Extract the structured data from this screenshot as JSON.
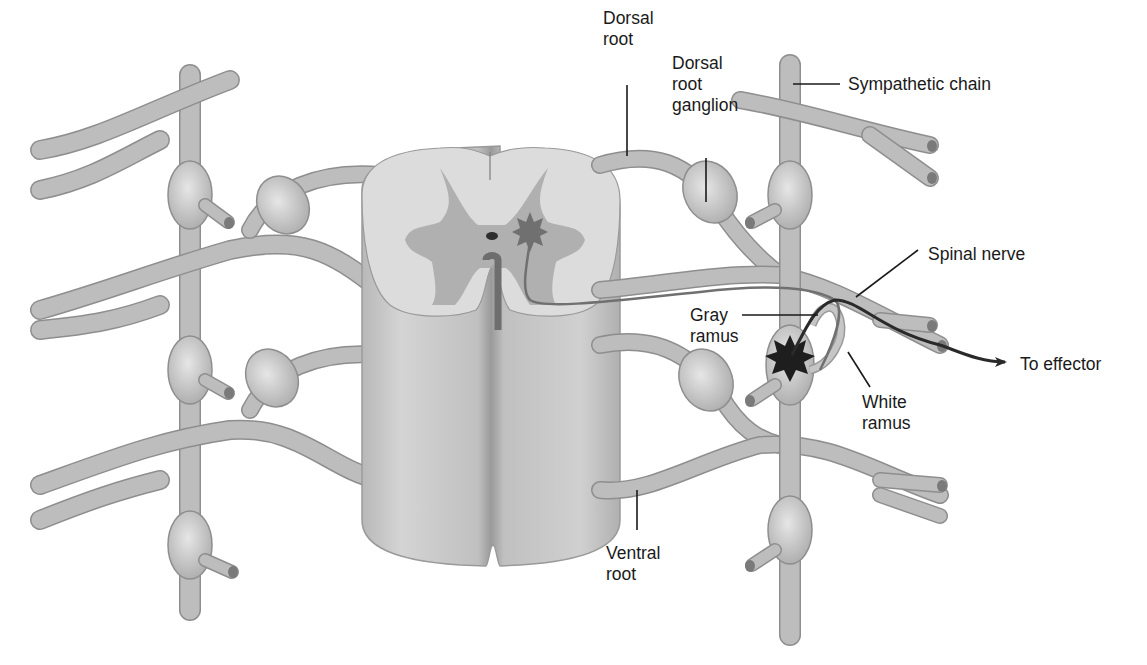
{
  "figure": {
    "colors": {
      "background": "#ffffff",
      "nerve_fill": "#c4c4c4",
      "nerve_edge": "#8e8e8e",
      "white_matter": "#dcdcdc",
      "gray_matter": "#a8a8a8",
      "preganglionic_neuron": "#707070",
      "postganglionic_neuron": "#1e1e1e",
      "label_text": "#1a1a1a"
    }
  },
  "labels": {
    "dorsal_root": "Dorsal\nroot",
    "dorsal_root_ganglion": "Dorsal\nroot\nganglion",
    "sympathetic_chain": "Sympathetic chain",
    "spinal_nerve": "Spinal nerve",
    "gray_ramus": "Gray\nramus",
    "to_effector": "To effector",
    "white_ramus": "White\nramus",
    "ventral_root": "Ventral\nroot"
  }
}
